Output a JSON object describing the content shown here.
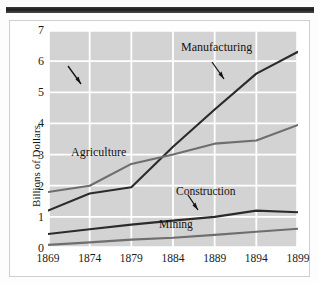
{
  "figure": {
    "y_axis_title": "Billions of Dollars",
    "top_rule": true
  },
  "annotations": {
    "manufacturing": "Manufacturing",
    "agriculture": "Agriculture",
    "construction": "Construction",
    "mining": "Mining"
  },
  "colors": {
    "plot_background": "#d3d3d3",
    "gridline": "#ffffff",
    "dark_series": "#2b2b2b",
    "gray_series": "#6e6e6e",
    "text": "#141414",
    "top_rule": "#242424"
  },
  "chart_data": {
    "type": "line",
    "title": "",
    "xlabel": "",
    "ylabel": "Billions of Dollars",
    "x": [
      1869,
      1874,
      1879,
      1884,
      1889,
      1894,
      1899
    ],
    "xtick_labels": [
      "1869",
      "1874",
      "1879",
      "1884",
      "1889",
      "1894",
      "1899"
    ],
    "ytick_labels": [
      "0",
      "1",
      "2",
      "3",
      "4",
      "5",
      "6",
      "7"
    ],
    "ylim": [
      0,
      7
    ],
    "xlim": [
      1869,
      1899
    ],
    "grid": true,
    "legend": "inline-annotations",
    "series": [
      {
        "name": "Manufacturing",
        "color": "#2b2b2b",
        "values": [
          1.2,
          1.75,
          1.95,
          3.25,
          4.45,
          5.6,
          6.3
        ]
      },
      {
        "name": "Agriculture",
        "color": "#6e6e6e",
        "values": [
          1.8,
          2.0,
          2.7,
          3.0,
          3.35,
          3.45,
          3.95
        ]
      },
      {
        "name": "Construction",
        "color": "#2b2b2b",
        "values": [
          0.45,
          0.6,
          0.75,
          0.88,
          1.0,
          1.2,
          1.15
        ]
      },
      {
        "name": "Mining",
        "color": "#6e6e6e",
        "values": [
          0.1,
          0.18,
          0.27,
          0.33,
          0.42,
          0.52,
          0.62
        ]
      }
    ]
  }
}
